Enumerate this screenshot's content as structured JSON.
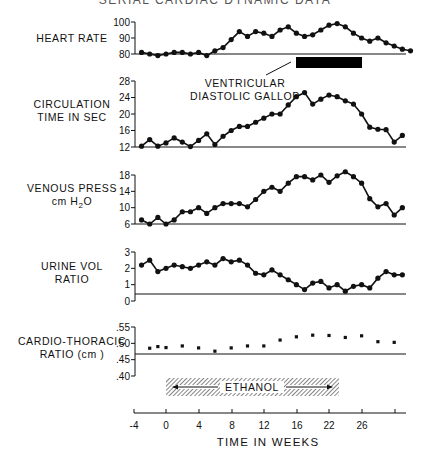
{
  "title": "SERIAL CARDIAC DYNAMIC DATA",
  "annotations": {
    "gallop_label_1": "VENTRICULAR",
    "gallop_label_2": "DIASTOLIC GALLOP",
    "ethanol_label": "ETHANOL"
  },
  "x_axis": {
    "label": "TIME IN WEEKS",
    "ticks": [
      "-4",
      "0",
      "4",
      "8",
      "12",
      "16",
      "22",
      "26",
      ""
    ]
  },
  "panels": [
    {
      "label_lines": [
        "HEART RATE"
      ],
      "ticks": [
        "100",
        "90",
        "80"
      ]
    },
    {
      "label_lines": [
        "CIRCULATION",
        "TIME IN SEC"
      ],
      "ticks": [
        "28",
        "24",
        "20",
        "16",
        "12"
      ]
    },
    {
      "label_lines": [
        "VENOUS PRESS",
        "cm H2O"
      ],
      "ticks": [
        "18",
        "14",
        "10",
        "6"
      ]
    },
    {
      "label_lines": [
        "URINE VOL",
        "RATIO"
      ],
      "ticks": [
        "3",
        "2",
        "1",
        "0"
      ]
    },
    {
      "label_lines": [
        "CARDIO-THORACIC",
        "RATIO (cm )"
      ],
      "ticks": [
        ".55",
        ".50",
        ".45",
        ".40"
      ]
    }
  ],
  "chart_data": [
    {
      "type": "line",
      "title": "HEART RATE",
      "xlabel": "TIME IN WEEKS",
      "ylabel": "HEART RATE",
      "ylim": [
        80,
        100
      ],
      "x": [
        -3,
        -2,
        -1,
        0,
        1,
        2,
        3,
        4,
        5,
        6,
        7,
        8,
        9,
        10,
        11,
        12,
        13,
        14,
        15,
        16,
        17,
        18,
        19,
        20,
        21,
        22,
        23,
        24,
        25,
        26,
        27,
        28,
        29,
        30
      ],
      "values": [
        81,
        80,
        79,
        80,
        81,
        81,
        80,
        81,
        79,
        82,
        84,
        89,
        94,
        91,
        94,
        93,
        91,
        95,
        97,
        93,
        91,
        92,
        95,
        98,
        99,
        97,
        93,
        90,
        88,
        90,
        87,
        85,
        83,
        82
      ],
      "annotations": [
        {
          "text": "VENTRICULAR DIASTOLIC GALLOP",
          "x_range": [
            16,
            24
          ]
        }
      ]
    },
    {
      "type": "line",
      "title": "CIRCULATION TIME IN SEC",
      "xlabel": "TIME IN WEEKS",
      "ylabel": "CIRCULATION TIME IN SEC",
      "ylim": [
        12,
        28
      ],
      "x": [
        -3,
        -2,
        -1,
        0,
        1,
        2,
        3,
        4,
        5,
        6,
        7,
        8,
        9,
        10,
        11,
        12,
        13,
        14,
        15,
        16,
        17,
        18,
        19,
        20,
        21,
        22,
        23,
        24,
        25,
        26,
        27,
        28,
        29,
        30
      ],
      "values": [
        12.2,
        13.8,
        12.2,
        13,
        14.2,
        13.2,
        12.1,
        13.6,
        15.2,
        12.6,
        14.6,
        16,
        17,
        17,
        18,
        19,
        20,
        20,
        22.2,
        24.2,
        25.2,
        22.4,
        23.6,
        24.6,
        24.2,
        23.2,
        22.4,
        20,
        16.8,
        16.3,
        16.2,
        13.2,
        14.8,
        null
      ],
      "note": "33 points, last at ~week 29.5"
    },
    {
      "type": "line",
      "title": "VENOUS PRESS cm H2O",
      "xlabel": "TIME IN WEEKS",
      "ylabel": "VENOUS PRESS cm H2O",
      "ylim": [
        6,
        18
      ],
      "x": [
        -3,
        -2,
        -1,
        0,
        1,
        2,
        3,
        4,
        5,
        6,
        7,
        8,
        9,
        10,
        11,
        12,
        13,
        14,
        15,
        16,
        17,
        18,
        19,
        20,
        21,
        22,
        23,
        24,
        25,
        26,
        27,
        28,
        29,
        30
      ],
      "values": [
        7,
        6,
        7.6,
        6,
        7,
        9,
        9,
        10,
        8.6,
        10,
        11,
        11,
        11,
        10.2,
        12,
        14,
        15,
        14,
        16,
        17.6,
        17.6,
        16.8,
        18,
        16.2,
        17.8,
        18.8,
        17.6,
        16,
        12.2,
        10.2,
        11,
        8.2,
        10,
        null
      ]
    },
    {
      "type": "line",
      "title": "URINE VOL RATIO",
      "xlabel": "TIME IN WEEKS",
      "ylabel": "URINE VOL RATIO",
      "ylim": [
        0,
        3
      ],
      "reference_line": 0.4,
      "x": [
        -3,
        -2,
        -1,
        0,
        1,
        2,
        3,
        4,
        5,
        6,
        7,
        8,
        9,
        10,
        11,
        12,
        13,
        14,
        15,
        16,
        17,
        18,
        19,
        20,
        21,
        22,
        23,
        24,
        25,
        26,
        27,
        28,
        29,
        30
      ],
      "values": [
        2.2,
        2.5,
        1.8,
        2,
        2.2,
        2.1,
        2,
        2.2,
        2.4,
        2.2,
        2.6,
        2.4,
        2.5,
        2.2,
        1.7,
        1.6,
        1.9,
        1.6,
        1.3,
        1,
        0.7,
        1.1,
        1.2,
        0.8,
        1,
        0.6,
        0.9,
        1,
        0.8,
        1.4,
        1.8,
        1.6,
        1.6,
        null
      ]
    },
    {
      "type": "scatter",
      "title": "CARDIO-THORACIC RATIO (cm )",
      "xlabel": "TIME IN WEEKS",
      "ylabel": "CARDIO-THORACIC RATIO (cm )",
      "ylim": [
        0.4,
        0.55
      ],
      "reference_line": 0.47,
      "x": [
        -2,
        -1,
        0,
        2,
        4,
        6,
        8,
        10,
        12,
        14,
        16,
        18,
        20,
        22,
        24,
        26,
        28
      ],
      "values": [
        0.485,
        0.49,
        0.487,
        0.492,
        0.486,
        0.476,
        0.486,
        0.492,
        0.492,
        0.51,
        0.52,
        0.525,
        0.524,
        0.518,
        0.523,
        0.505,
        0.503
      ]
    }
  ],
  "ethanol_period": {
    "start_week": 0,
    "end_week": 21.5
  },
  "gallop_period": {
    "start_week": 16,
    "end_week": 24
  }
}
